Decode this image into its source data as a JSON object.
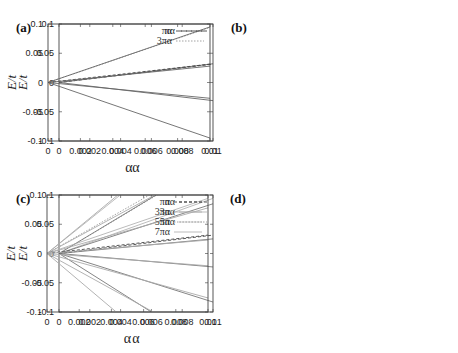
{
  "chart_data": [
    {
      "type": "line",
      "panel": "(a)",
      "xlabel": "α",
      "ylabel": "E/t",
      "xlim": [
        0,
        0.01
      ],
      "ylim": [
        -0.1,
        0.1
      ],
      "xticks": [
        "0",
        "0.002",
        "0.004",
        "0.006",
        "0.008",
        "0.01"
      ],
      "yticks": [
        "0.1",
        "0.05",
        "0",
        "-0.05",
        "-0.1"
      ],
      "legend_position": "top-right",
      "reference_lines": [
        {
          "name": "πα",
          "slope": 3.1416,
          "style": "dashed"
        }
      ],
      "series": [
        {
          "name": "level 1",
          "x": [
            0,
            0.01
          ],
          "y": [
            0,
            0.032
          ]
        },
        {
          "name": "level -1",
          "x": [
            0,
            0.01
          ],
          "y": [
            0,
            -0.031
          ]
        }
      ]
    },
    {
      "type": "line",
      "panel": "(b)",
      "xlabel": "α",
      "ylabel": "E/t",
      "xlim": [
        0,
        0.01
      ],
      "ylim": [
        -0.1,
        0.1
      ],
      "xticks": [
        "0",
        "0.002",
        "0.004",
        "0.006",
        "0.008",
        "0.01"
      ],
      "yticks": [
        "0.1",
        "0.05",
        "0",
        "-0.05",
        "-0.1"
      ],
      "legend_position": "top-right",
      "reference_lines": [
        {
          "name": "πα",
          "slope": 3.1416,
          "style": "dashed"
        },
        {
          "name": "3πα",
          "slope": 9.4248,
          "style": "dotted"
        }
      ],
      "series": [
        {
          "name": "level 2",
          "x": [
            0,
            0.01
          ],
          "y": [
            0,
            0.095
          ]
        },
        {
          "name": "level 1",
          "x": [
            0,
            0.01
          ],
          "y": [
            0,
            0.028
          ]
        },
        {
          "name": "level -1",
          "x": [
            0,
            0.01
          ],
          "y": [
            0,
            -0.027
          ]
        },
        {
          "name": "level -2",
          "x": [
            0,
            0.01
          ],
          "y": [
            0,
            -0.095
          ]
        }
      ]
    },
    {
      "type": "line",
      "panel": "(c)",
      "xlabel": "α",
      "ylabel": "E/t",
      "xlim": [
        0,
        0.01
      ],
      "ylim": [
        -0.1,
        0.1
      ],
      "xticks": [
        "0",
        "0.002",
        "0.004",
        "0.006",
        "0.008",
        "0.01"
      ],
      "yticks": [
        "0.1",
        "0.05",
        "0",
        "-0.05",
        "-0.1"
      ],
      "legend_position": "top-right",
      "reference_lines": [
        {
          "name": "πα",
          "slope": 3.1416,
          "style": "dashed"
        },
        {
          "name": "3πα",
          "slope": 9.4248,
          "style": "solid-light"
        },
        {
          "name": "5πα",
          "slope": 15.708,
          "style": "dotted"
        }
      ],
      "series": [
        {
          "name": "level 3",
          "x": [
            0,
            0.0063
          ],
          "y": [
            0,
            0.1
          ]
        },
        {
          "name": "level 2",
          "x": [
            0,
            0.01
          ],
          "y": [
            0,
            0.085
          ]
        },
        {
          "name": "level 1",
          "x": [
            0,
            0.01
          ],
          "y": [
            0,
            0.025
          ]
        },
        {
          "name": "level -1",
          "x": [
            0,
            0.01
          ],
          "y": [
            0,
            -0.023
          ]
        },
        {
          "name": "level -2",
          "x": [
            0,
            0.01
          ],
          "y": [
            0,
            -0.083
          ]
        },
        {
          "name": "level -3",
          "x": [
            0,
            0.006
          ],
          "y": [
            0,
            -0.1
          ]
        }
      ]
    },
    {
      "type": "line",
      "panel": "(d)",
      "xlabel": "α",
      "ylabel": "E/t",
      "xlim": [
        0,
        0.01
      ],
      "ylim": [
        -0.1,
        0.1
      ],
      "xticks": [
        "0",
        "0.002",
        "0.004",
        "0.006",
        "0.008",
        "0.01"
      ],
      "yticks": [
        "0.1",
        "0.05",
        "0",
        "-0.05",
        "-0.1"
      ],
      "legend_position": "top-right",
      "reference_lines": [
        {
          "name": "πα",
          "slope": 3.1416,
          "style": "dashed"
        },
        {
          "name": "3πα",
          "slope": 9.4248,
          "style": "solid-light"
        },
        {
          "name": "5πα",
          "slope": 15.708,
          "style": "dotted"
        },
        {
          "name": "7πα",
          "slope": 21.991,
          "style": "solid-light"
        }
      ],
      "series": [
        {
          "name": "level 4",
          "x": [
            0,
            0.0044
          ],
          "y": [
            0,
            0.1
          ]
        },
        {
          "name": "level 3",
          "x": [
            0,
            0.0067
          ],
          "y": [
            0,
            0.1
          ]
        },
        {
          "name": "level 2",
          "x": [
            0,
            0.01
          ],
          "y": [
            0,
            0.078
          ]
        },
        {
          "name": "level 1",
          "x": [
            0,
            0.01
          ],
          "y": [
            0,
            0.023
          ]
        },
        {
          "name": "level -1",
          "x": [
            0,
            0.01
          ],
          "y": [
            0,
            -0.021
          ]
        },
        {
          "name": "level -2",
          "x": [
            0,
            0.01
          ],
          "y": [
            0,
            -0.076
          ]
        },
        {
          "name": "level -3",
          "x": [
            0,
            0.0066
          ],
          "y": [
            0,
            -0.1
          ]
        },
        {
          "name": "level -4",
          "x": [
            0,
            0.0043
          ],
          "y": [
            0,
            -0.1
          ]
        }
      ]
    }
  ]
}
